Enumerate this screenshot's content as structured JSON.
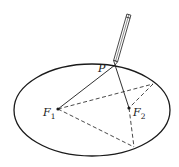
{
  "diagram": {
    "title": "",
    "ellipse": {
      "cx": 92,
      "cy": 110,
      "rx": 78,
      "ry": 46,
      "stroke": "#1a1a1a"
    },
    "points": {
      "P": {
        "x": 115,
        "y": 65,
        "label": "P"
      },
      "F1": {
        "x": 58,
        "y": 109,
        "label": "F",
        "subscript": "1"
      },
      "F2": {
        "x": 129,
        "y": 108,
        "label": "F",
        "subscript": "2"
      },
      "Q": {
        "x": 153,
        "y": 84
      },
      "R": {
        "x": 134,
        "y": 147
      }
    },
    "solid_segments": [
      {
        "from": "P",
        "to": "F1"
      },
      {
        "from": "P",
        "to": "F2"
      }
    ],
    "dashed_segments": [
      {
        "from": "F1",
        "to": "Q"
      },
      {
        "from": "Q",
        "to": "F2"
      },
      {
        "from": "F1",
        "to": "R"
      },
      {
        "from": "F2",
        "to": "R"
      }
    ],
    "pen": {
      "tip_x": 115,
      "tip_y": 65,
      "top_x": 129,
      "top_y": 14
    },
    "colors": {
      "line": "#1a1a1a",
      "background": "#ffffff"
    }
  }
}
